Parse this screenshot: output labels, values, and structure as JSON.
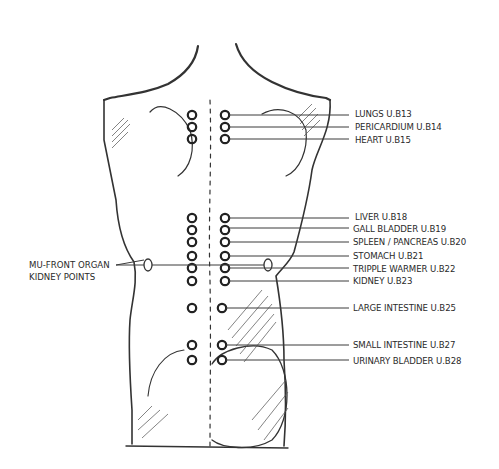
{
  "diagram": {
    "type": "anatomical-back-acupuncture-points",
    "colors": {
      "ink": "#2a2a2a",
      "line": "#3a3a3a",
      "background": "#ffffff"
    },
    "right_labels": [
      {
        "text": "LUNGS U.B13",
        "y": 113
      },
      {
        "text": "PERICARDIUM U.B14",
        "y": 127
      },
      {
        "text": "HEART U.B15",
        "y": 140
      },
      {
        "text": "LIVER U.B18",
        "y": 216
      },
      {
        "text": "GALL BLADDER U.B19",
        "y": 228
      },
      {
        "text": "SPLEEN / PANCREAS U.B20",
        "y": 242
      },
      {
        "text": "STOMACH U.B21",
        "y": 256
      },
      {
        "text": "TRIPPLE WARMER U.B22",
        "y": 268
      },
      {
        "text": "KIDNEY U.B23",
        "y": 280
      },
      {
        "text": "LARGE INTESTINE U.B25",
        "y": 307
      },
      {
        "text": "SMALL INTESTINE U.B27",
        "y": 344
      },
      {
        "text": "URINARY BLADDER U.B28",
        "y": 361
      }
    ],
    "left_label": {
      "line1": "MU-FRONT ORGAN",
      "line2": "KIDNEY POINTS"
    }
  }
}
